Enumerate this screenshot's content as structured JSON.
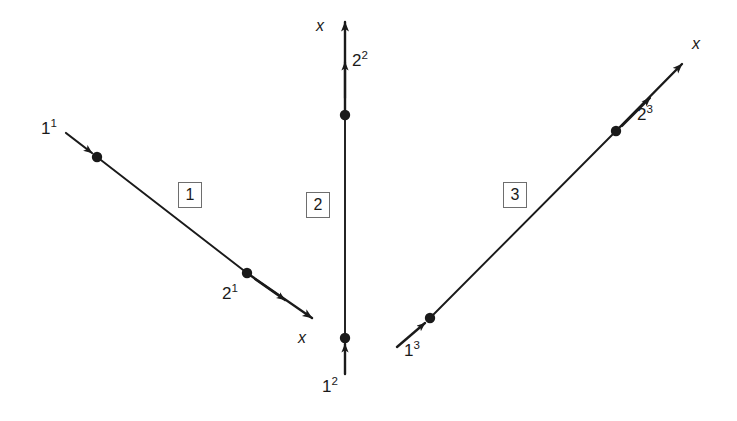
{
  "figure": {
    "width": 737,
    "height": 421,
    "background": "#ffffff",
    "line_color": "#1a1a1a",
    "box_border_color": "#6e6e6e"
  },
  "elements": [
    {
      "box_label": "1",
      "box_x": 178,
      "box_y": 182,
      "line": {
        "x1": 97,
        "y1": 157,
        "x2": 315,
        "y2": 320
      },
      "start_node": {
        "label_html": "1<sup>1</sup>",
        "cx": 97,
        "cy": 157,
        "label_x": 41,
        "label_y": 120
      },
      "end_node": {
        "label_html": "2<sup>1</sup>",
        "cx": 247,
        "cy": 273,
        "label_x": 222,
        "label_y": 285
      },
      "axis_label": "x",
      "axis_label_x": 298,
      "axis_label_y": 330
    },
    {
      "box_label": "2",
      "box_x": 306,
      "box_y": 192,
      "line": {
        "x1": 345,
        "y1": 352,
        "x2": 345,
        "y2": 22
      },
      "start_node": {
        "label_html": "1<sup>2</sup>",
        "cx": 345,
        "cy": 338,
        "label_x": 322,
        "label_y": 378
      },
      "end_node": {
        "label_html": "2<sup>2</sup>",
        "cx": 345,
        "cy": 115,
        "label_x": 352,
        "label_y": 52
      },
      "axis_label": "x",
      "axis_label_x": 316,
      "axis_label_y": 18
    },
    {
      "box_label": "3",
      "box_x": 503,
      "box_y": 182,
      "line": {
        "x1": 420,
        "y1": 328,
        "x2": 686,
        "y2": 60
      },
      "start_node": {
        "label_html": "1<sup>3</sup>",
        "cx": 430,
        "cy": 318,
        "label_x": 404,
        "label_y": 342
      },
      "end_node": {
        "label_html": "2<sup>3</sup>",
        "cx": 616,
        "cy": 131,
        "label_x": 637,
        "label_y": 106
      },
      "axis_label": "x",
      "axis_label_x": 692,
      "axis_label_y": 36
    }
  ]
}
